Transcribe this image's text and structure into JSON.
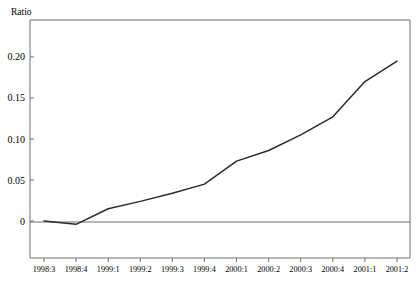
{
  "chart_data": {
    "type": "line",
    "title": "",
    "ylabel": "Ratio",
    "xlabel": "",
    "categories": [
      "1998:3",
      "1998:4",
      "1999:1",
      "1999:2",
      "1999:3",
      "1999:4",
      "2000:1",
      "2000:2",
      "2000:3",
      "2000:4",
      "2001:1",
      "2001:2"
    ],
    "values": [
      0.0,
      -0.004,
      0.015,
      0.024,
      0.034,
      0.045,
      0.073,
      0.086,
      0.105,
      0.127,
      0.17,
      0.195
    ],
    "series": [
      {
        "name": "Ratio",
        "values": [
          0.0,
          -0.004,
          0.015,
          0.024,
          0.034,
          0.045,
          0.073,
          0.086,
          0.105,
          0.127,
          0.17,
          0.195
        ]
      }
    ],
    "ytick_labels": [
      "0.20",
      "0.15",
      "0.10",
      "0.05",
      "0"
    ],
    "ytick_values": [
      0.2,
      0.15,
      0.1,
      0.05,
      0
    ],
    "ylim": [
      -0.045,
      0.245
    ],
    "xlim": [
      0,
      11
    ],
    "grid": false,
    "legend": false,
    "legend_position": "none",
    "line_color": "#2b2b2b",
    "frame_color": "#6f6f6f",
    "zero_reference_line": true
  },
  "figure": {
    "background_color": "#ffffff",
    "axis_title_text": "Ratio"
  }
}
